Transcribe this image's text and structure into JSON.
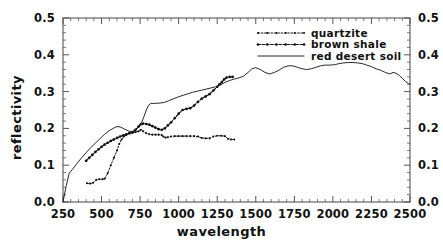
{
  "chart_data": {
    "type": "line",
    "title": "",
    "xlabel": "wavelength",
    "ylabel": "reflectivity",
    "xlim": [
      250,
      2500
    ],
    "ylim": [
      0.0,
      0.5
    ],
    "xticks": [
      250,
      500,
      750,
      1000,
      1250,
      1500,
      1750,
      2000,
      2250,
      2500
    ],
    "xtick_labels": [
      "250",
      "500",
      "750",
      "1000",
      "1250",
      "1500",
      "1750",
      "2000",
      "2250",
      "2500"
    ],
    "yticks": [
      0.0,
      0.1,
      0.2,
      0.3,
      0.4,
      0.5
    ],
    "ytick_labels": [
      "0.0",
      "0.1",
      "0.2",
      "0.3",
      "0.4",
      "0.5"
    ],
    "right_axis_labels": [
      "0.0",
      "0.1",
      "0.2",
      "0.3",
      "0.4",
      "0.5"
    ],
    "grid": false,
    "legend_position": "top-right",
    "series": [
      {
        "name": "quartzite",
        "style": "dotted-marker",
        "color": "#111111",
        "points": [
          [
            405,
            0.051
          ],
          [
            425,
            0.05
          ],
          [
            445,
            0.052
          ],
          [
            465,
            0.06
          ],
          [
            485,
            0.062
          ],
          [
            505,
            0.062
          ],
          [
            520,
            0.063
          ],
          [
            540,
            0.078
          ],
          [
            560,
            0.1
          ],
          [
            580,
            0.12
          ],
          [
            600,
            0.14
          ],
          [
            615,
            0.158
          ],
          [
            630,
            0.17
          ],
          [
            645,
            0.178
          ],
          [
            660,
            0.182
          ],
          [
            680,
            0.186
          ],
          [
            700,
            0.188
          ],
          [
            720,
            0.19
          ],
          [
            740,
            0.192
          ],
          [
            755,
            0.196
          ],
          [
            770,
            0.192
          ],
          [
            790,
            0.187
          ],
          [
            810,
            0.184
          ],
          [
            830,
            0.183
          ],
          [
            850,
            0.183
          ],
          [
            870,
            0.183
          ],
          [
            890,
            0.182
          ],
          [
            900,
            0.178
          ],
          [
            915,
            0.175
          ],
          [
            930,
            0.176
          ],
          [
            950,
            0.178
          ],
          [
            975,
            0.179
          ],
          [
            1000,
            0.179
          ],
          [
            1025,
            0.179
          ],
          [
            1050,
            0.179
          ],
          [
            1075,
            0.179
          ],
          [
            1100,
            0.179
          ],
          [
            1125,
            0.178
          ],
          [
            1150,
            0.174
          ],
          [
            1175,
            0.173
          ],
          [
            1200,
            0.173
          ],
          [
            1225,
            0.178
          ],
          [
            1250,
            0.18
          ],
          [
            1275,
            0.18
          ],
          [
            1300,
            0.179
          ],
          [
            1320,
            0.172
          ],
          [
            1340,
            0.17
          ],
          [
            1360,
            0.17
          ]
        ]
      },
      {
        "name": "brown shale",
        "style": "dashed-marker",
        "color": "#111111",
        "points": [
          [
            400,
            0.112
          ],
          [
            420,
            0.12
          ],
          [
            440,
            0.128
          ],
          [
            460,
            0.136
          ],
          [
            480,
            0.143
          ],
          [
            500,
            0.15
          ],
          [
            520,
            0.156
          ],
          [
            540,
            0.161
          ],
          [
            560,
            0.166
          ],
          [
            580,
            0.17
          ],
          [
            600,
            0.174
          ],
          [
            620,
            0.178
          ],
          [
            640,
            0.181
          ],
          [
            660,
            0.184
          ],
          [
            680,
            0.187
          ],
          [
            700,
            0.189
          ],
          [
            720,
            0.196
          ],
          [
            740,
            0.205
          ],
          [
            755,
            0.211
          ],
          [
            770,
            0.213
          ],
          [
            790,
            0.212
          ],
          [
            810,
            0.21
          ],
          [
            830,
            0.206
          ],
          [
            850,
            0.202
          ],
          [
            870,
            0.198
          ],
          [
            890,
            0.196
          ],
          [
            910,
            0.2
          ],
          [
            930,
            0.208
          ],
          [
            950,
            0.216
          ],
          [
            975,
            0.228
          ],
          [
            1000,
            0.24
          ],
          [
            1025,
            0.25
          ],
          [
            1050,
            0.253
          ],
          [
            1075,
            0.255
          ],
          [
            1100,
            0.262
          ],
          [
            1125,
            0.272
          ],
          [
            1150,
            0.281
          ],
          [
            1175,
            0.287
          ],
          [
            1200,
            0.293
          ],
          [
            1225,
            0.303
          ],
          [
            1250,
            0.313
          ],
          [
            1265,
            0.32
          ],
          [
            1280,
            0.326
          ],
          [
            1295,
            0.333
          ],
          [
            1310,
            0.338
          ],
          [
            1330,
            0.34
          ],
          [
            1350,
            0.34
          ]
        ]
      },
      {
        "name": "red desert soil",
        "style": "solid",
        "color": "#111111",
        "points": [
          [
            250,
            0.0
          ],
          [
            270,
            0.042
          ],
          [
            290,
            0.078
          ],
          [
            310,
            0.088
          ],
          [
            340,
            0.104
          ],
          [
            370,
            0.12
          ],
          [
            400,
            0.134
          ],
          [
            430,
            0.148
          ],
          [
            460,
            0.16
          ],
          [
            490,
            0.172
          ],
          [
            520,
            0.184
          ],
          [
            550,
            0.194
          ],
          [
            575,
            0.2
          ],
          [
            600,
            0.205
          ],
          [
            620,
            0.204
          ],
          [
            640,
            0.2
          ],
          [
            660,
            0.196
          ],
          [
            680,
            0.192
          ],
          [
            700,
            0.192
          ],
          [
            720,
            0.196
          ],
          [
            740,
            0.204
          ],
          [
            760,
            0.216
          ],
          [
            775,
            0.232
          ],
          [
            790,
            0.25
          ],
          [
            805,
            0.263
          ],
          [
            820,
            0.268
          ],
          [
            850,
            0.268
          ],
          [
            880,
            0.269
          ],
          [
            910,
            0.271
          ],
          [
            940,
            0.276
          ],
          [
            970,
            0.281
          ],
          [
            1000,
            0.286
          ],
          [
            1030,
            0.29
          ],
          [
            1060,
            0.294
          ],
          [
            1090,
            0.298
          ],
          [
            1120,
            0.301
          ],
          [
            1150,
            0.304
          ],
          [
            1180,
            0.307
          ],
          [
            1210,
            0.31
          ],
          [
            1240,
            0.313
          ],
          [
            1270,
            0.318
          ],
          [
            1300,
            0.325
          ],
          [
            1330,
            0.33
          ],
          [
            1360,
            0.334
          ],
          [
            1390,
            0.337
          ],
          [
            1420,
            0.342
          ],
          [
            1450,
            0.352
          ],
          [
            1475,
            0.362
          ],
          [
            1500,
            0.365
          ],
          [
            1530,
            0.36
          ],
          [
            1560,
            0.352
          ],
          [
            1590,
            0.348
          ],
          [
            1620,
            0.352
          ],
          [
            1650,
            0.358
          ],
          [
            1680,
            0.366
          ],
          [
            1710,
            0.37
          ],
          [
            1740,
            0.37
          ],
          [
            1770,
            0.366
          ],
          [
            1800,
            0.362
          ],
          [
            1830,
            0.36
          ],
          [
            1860,
            0.362
          ],
          [
            1890,
            0.366
          ],
          [
            1920,
            0.37
          ],
          [
            1950,
            0.372
          ],
          [
            1980,
            0.372
          ],
          [
            2010,
            0.373
          ],
          [
            2040,
            0.376
          ],
          [
            2070,
            0.378
          ],
          [
            2100,
            0.379
          ],
          [
            2130,
            0.379
          ],
          [
            2160,
            0.378
          ],
          [
            2190,
            0.376
          ],
          [
            2220,
            0.372
          ],
          [
            2250,
            0.368
          ],
          [
            2280,
            0.362
          ],
          [
            2310,
            0.358
          ],
          [
            2340,
            0.352
          ],
          [
            2370,
            0.348
          ],
          [
            2390,
            0.352
          ],
          [
            2410,
            0.35
          ],
          [
            2430,
            0.344
          ],
          [
            2450,
            0.336
          ],
          [
            2470,
            0.328
          ],
          [
            2490,
            0.322
          ],
          [
            2500,
            0.32
          ]
        ]
      }
    ],
    "legend": [
      {
        "label": "quartzite",
        "style": "dotted-marker"
      },
      {
        "label": "brown shale",
        "style": "dashed-marker"
      },
      {
        "label": "red desert soil",
        "style": "solid"
      }
    ]
  }
}
